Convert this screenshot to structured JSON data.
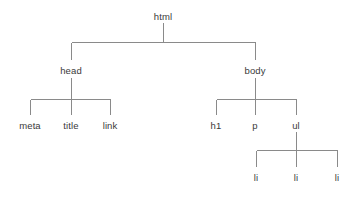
{
  "diagram": {
    "type": "tree",
    "background_color": "#ffffff",
    "line_color": "#8a8a8a",
    "text_color": "#3a3a3a",
    "nodes": [
      {
        "id": "html",
        "label": "html",
        "x": 163,
        "y": 11,
        "level": 0,
        "parent": null
      },
      {
        "id": "head",
        "label": "head",
        "x": 71,
        "y": 65,
        "level": 1,
        "parent": "html"
      },
      {
        "id": "body",
        "label": "body",
        "x": 255,
        "y": 65,
        "level": 1,
        "parent": "html"
      },
      {
        "id": "meta",
        "label": "meta",
        "x": 30,
        "y": 120,
        "level": 2,
        "parent": "head"
      },
      {
        "id": "title",
        "label": "title",
        "x": 71,
        "y": 120,
        "level": 2,
        "parent": "head"
      },
      {
        "id": "link",
        "label": "link",
        "x": 110,
        "y": 120,
        "level": 2,
        "parent": "head"
      },
      {
        "id": "h1",
        "label": "h1",
        "x": 216,
        "y": 120,
        "level": 2,
        "parent": "body"
      },
      {
        "id": "p",
        "label": "p",
        "x": 255,
        "y": 120,
        "level": 2,
        "parent": "body"
      },
      {
        "id": "ul",
        "label": "ul",
        "x": 296,
        "y": 120,
        "level": 2,
        "parent": "body"
      },
      {
        "id": "li1",
        "label": "li",
        "x": 256,
        "y": 172,
        "level": 3,
        "parent": "ul"
      },
      {
        "id": "li2",
        "label": "li",
        "x": 296,
        "y": 172,
        "level": 3,
        "parent": "ul"
      },
      {
        "id": "li3",
        "label": "li",
        "x": 337,
        "y": 172,
        "level": 3,
        "parent": "ul"
      }
    ],
    "edges": [
      {
        "from": "html",
        "to": "head"
      },
      {
        "from": "html",
        "to": "body"
      },
      {
        "from": "head",
        "to": "meta"
      },
      {
        "from": "head",
        "to": "title"
      },
      {
        "from": "head",
        "to": "link"
      },
      {
        "from": "body",
        "to": "h1"
      },
      {
        "from": "body",
        "to": "p"
      },
      {
        "from": "body",
        "to": "ul"
      },
      {
        "from": "ul",
        "to": "li1"
      },
      {
        "from": "ul",
        "to": "li2"
      },
      {
        "from": "ul",
        "to": "li3"
      }
    ]
  }
}
